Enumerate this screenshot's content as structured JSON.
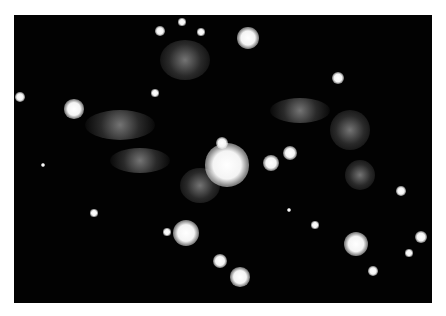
{
  "image": {
    "subject": "star field with central bright star and surrounding nebulosity",
    "frame": {
      "left": 14,
      "top": 15,
      "width": 418,
      "height": 288,
      "background": "#020202",
      "border_color": "#ffffff"
    },
    "stars": [
      {
        "x": 227,
        "y": 165,
        "r": 18
      },
      {
        "x": 222,
        "y": 143,
        "r": 5
      },
      {
        "x": 271,
        "y": 163,
        "r": 7
      },
      {
        "x": 290,
        "y": 153,
        "r": 6
      },
      {
        "x": 248,
        "y": 38,
        "r": 9
      },
      {
        "x": 160,
        "y": 31,
        "r": 4
      },
      {
        "x": 182,
        "y": 22,
        "r": 3
      },
      {
        "x": 201,
        "y": 32,
        "r": 3
      },
      {
        "x": 20,
        "y": 97,
        "r": 4
      },
      {
        "x": 74,
        "y": 109,
        "r": 8
      },
      {
        "x": 155,
        "y": 93,
        "r": 3
      },
      {
        "x": 338,
        "y": 78,
        "r": 5
      },
      {
        "x": 401,
        "y": 191,
        "r": 4
      },
      {
        "x": 186,
        "y": 233,
        "r": 11
      },
      {
        "x": 167,
        "y": 232,
        "r": 3
      },
      {
        "x": 356,
        "y": 244,
        "r": 10
      },
      {
        "x": 421,
        "y": 237,
        "r": 5
      },
      {
        "x": 409,
        "y": 253,
        "r": 3
      },
      {
        "x": 373,
        "y": 271,
        "r": 4
      },
      {
        "x": 220,
        "y": 261,
        "r": 6
      },
      {
        "x": 240,
        "y": 277,
        "r": 8
      },
      {
        "x": 94,
        "y": 213,
        "r": 3
      },
      {
        "x": 43,
        "y": 165,
        "r": 2
      },
      {
        "x": 315,
        "y": 225,
        "r": 3
      },
      {
        "x": 289,
        "y": 210,
        "r": 2
      }
    ],
    "wisps": [
      {
        "x": 120,
        "y": 125,
        "w": 70,
        "h": 30
      },
      {
        "x": 140,
        "y": 160,
        "w": 60,
        "h": 25
      },
      {
        "x": 300,
        "y": 110,
        "w": 60,
        "h": 25
      },
      {
        "x": 350,
        "y": 130,
        "w": 40,
        "h": 40
      },
      {
        "x": 200,
        "y": 185,
        "w": 40,
        "h": 35
      },
      {
        "x": 185,
        "y": 60,
        "w": 50,
        "h": 40
      },
      {
        "x": 360,
        "y": 175,
        "w": 30,
        "h": 30
      }
    ]
  }
}
